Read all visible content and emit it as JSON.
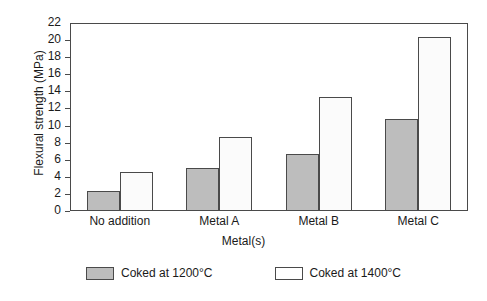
{
  "chart_data": {
    "type": "bar",
    "title": "",
    "categories": [
      "No addition",
      "Metal A",
      "Metal B",
      "Metal C"
    ],
    "series": [
      {
        "name": "Coked at 1200°C",
        "values": [
          2.4,
          5.0,
          6.7,
          10.8
        ],
        "color": "#bdbdbd"
      },
      {
        "name": "Coked at 1400°C",
        "values": [
          4.6,
          8.7,
          13.4,
          20.4
        ],
        "color": "#ffffff"
      }
    ],
    "xlabel": "Metal(s)",
    "ylabel": "Flexural strength (MPa)",
    "ylim": [
      0,
      22
    ],
    "ytick_step": 2,
    "yticks": [
      0,
      2,
      4,
      6,
      8,
      10,
      12,
      14,
      16,
      18,
      20,
      22
    ],
    "ytick_labels": [
      "0",
      "2",
      "4",
      "6",
      "8",
      "10",
      "12",
      "14",
      "16",
      "18",
      "20",
      "22"
    ],
    "grid": false,
    "legend_position": "bottom",
    "axis_color": "#4a4a4a",
    "bar_edge_color": "#4a4a4a"
  },
  "legend": {
    "entries": [
      {
        "label": "Coked at 1200°C"
      },
      {
        "label": "Coked at 1400°C"
      }
    ]
  }
}
